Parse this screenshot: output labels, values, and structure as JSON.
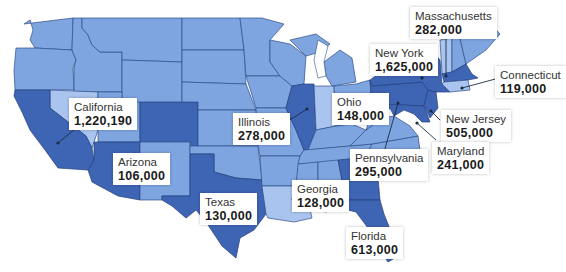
{
  "map": {
    "type": "choropleth",
    "region": "United States (contiguous)",
    "colors": {
      "highlighted": "#3e65b4",
      "base": "#7ea5e0",
      "secondary": "#5f8bd3",
      "pale": "#a9c4ee",
      "outline": "#2f4d86"
    }
  },
  "labels": [
    {
      "id": "california",
      "name": "California",
      "value": "1,220,190"
    },
    {
      "id": "arizona",
      "name": "Arizona",
      "value": "106,000"
    },
    {
      "id": "texas",
      "name": "Texas",
      "value": "130,000"
    },
    {
      "id": "illinois",
      "name": "Illinois",
      "value": "278,000"
    },
    {
      "id": "ohio",
      "name": "Ohio",
      "value": "148,000"
    },
    {
      "id": "new-york",
      "name": "New York",
      "value": "1,625,000"
    },
    {
      "id": "massachusetts",
      "name": "Massachusetts",
      "value": "282,000"
    },
    {
      "id": "connecticut",
      "name": "Connecticut",
      "value": "119,000"
    },
    {
      "id": "new-jersey",
      "name": "New Jersey",
      "value": "505,000"
    },
    {
      "id": "maryland",
      "name": "Maryland",
      "value": "241,000"
    },
    {
      "id": "pennsylvania",
      "name": "Pennsylvania",
      "value": "295,000"
    },
    {
      "id": "georgia",
      "name": "Georgia",
      "value": "128,000"
    },
    {
      "id": "florida",
      "name": "Florida",
      "value": "613,000"
    }
  ]
}
